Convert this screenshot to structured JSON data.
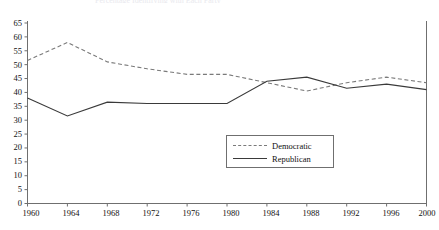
{
  "chart_data": {
    "type": "line",
    "title": "Percentage Identifying with Each Party",
    "xlabel": "",
    "ylabel": "",
    "x": [
      1960,
      1964,
      1968,
      1972,
      1976,
      1980,
      1984,
      1988,
      1992,
      1996,
      2000
    ],
    "xticklabels": [
      "1960",
      "1964",
      "1968",
      "1972",
      "1976",
      "1980",
      "1984",
      "1988",
      "1992",
      "1996",
      "2000"
    ],
    "yticklabels": [
      "0",
      "5",
      "10",
      "15",
      "20",
      "25",
      "30",
      "35",
      "40",
      "45",
      "50",
      "55",
      "60",
      "65"
    ],
    "ytickvalues": [
      0,
      5,
      10,
      15,
      20,
      25,
      30,
      35,
      40,
      45,
      50,
      55,
      60,
      65
    ],
    "ylim": [
      0,
      65
    ],
    "xlim": [
      1960,
      2000
    ],
    "grid": false,
    "legend_position": "center",
    "series": [
      {
        "name": "Democratic",
        "style": "dashed",
        "color": "#7a7a7a",
        "values": [
          51.5,
          58.0,
          51.0,
          48.5,
          46.5,
          46.5,
          43.5,
          40.5,
          43.5,
          45.5,
          43.5
        ]
      },
      {
        "name": "Republican",
        "style": "solid",
        "color": "#3a3a3a",
        "values": [
          38.0,
          31.5,
          36.5,
          36.0,
          36.0,
          36.0,
          44.0,
          45.5,
          41.5,
          43.0,
          41.0
        ]
      }
    ]
  },
  "legend": {
    "items": [
      {
        "label": "Democratic"
      },
      {
        "label": "Republican"
      }
    ]
  },
  "axes": {
    "axis_color": "#6f6f6f"
  }
}
